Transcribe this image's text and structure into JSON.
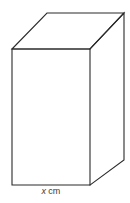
{
  "figure": {
    "kind": "cuboid-diagram",
    "background_color": "#ffffff",
    "stroke_color": "#2b2b2b",
    "face_fill_color": "#ffffff",
    "label": {
      "variable": "x",
      "unit": "cm",
      "full_text": "x cm",
      "position": "below-front-bottom-edge"
    },
    "vertices": {
      "front_top_left": [
        12,
        49
      ],
      "front_top_right": [
        90,
        49
      ],
      "front_bottom_right": [
        90,
        185
      ],
      "front_bottom_left": [
        12,
        185
      ],
      "back_top_left": [
        47,
        13
      ],
      "back_top_right": [
        124,
        13
      ],
      "back_bottom_right": [
        124,
        160
      ]
    },
    "edges": [
      "front-face-rectangle",
      "top-face-parallelogram",
      "right-face-parallelogram"
    ]
  }
}
